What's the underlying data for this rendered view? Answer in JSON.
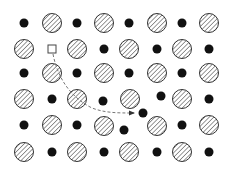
{
  "diagram": {
    "colors": {
      "background": "#ffffff",
      "atom_outline": "#333333",
      "hatch": "#555555",
      "small_atom": "#111111",
      "path": "#777777"
    },
    "large_atom_radius": 9.5,
    "small_atom_radius": 4.5,
    "large_atoms": [
      [
        52,
        23
      ],
      [
        104,
        23
      ],
      [
        157,
        23
      ],
      [
        209,
        23
      ],
      [
        24,
        49
      ],
      [
        77,
        49
      ],
      [
        129,
        49
      ],
      [
        182,
        49
      ],
      [
        52,
        73
      ],
      [
        104,
        73
      ],
      [
        157,
        73
      ],
      [
        209,
        73
      ],
      [
        24,
        99
      ],
      [
        77,
        99
      ],
      [
        130,
        99
      ],
      [
        182,
        99
      ],
      [
        52,
        125
      ],
      [
        104,
        126
      ],
      [
        157,
        126
      ],
      [
        209,
        125
      ],
      [
        24,
        152
      ],
      [
        77,
        152
      ],
      [
        129,
        152
      ],
      [
        182,
        152
      ]
    ],
    "small_atoms": [
      [
        24,
        23
      ],
      [
        77,
        23
      ],
      [
        129,
        23
      ],
      [
        182,
        23
      ],
      [
        104,
        49
      ],
      [
        157,
        49
      ],
      [
        209,
        49
      ],
      [
        24,
        73
      ],
      [
        77,
        73
      ],
      [
        129,
        73
      ],
      [
        182,
        73
      ],
      [
        52,
        99
      ],
      [
        103,
        101
      ],
      [
        161,
        96
      ],
      [
        209,
        99
      ],
      [
        24,
        125
      ],
      [
        77,
        125
      ],
      [
        124,
        130
      ],
      [
        182,
        125
      ],
      [
        52,
        152
      ],
      [
        104,
        152
      ],
      [
        157,
        152
      ],
      [
        209,
        152
      ]
    ],
    "interstitial_atom": [
      143,
      113
    ],
    "vacancy": {
      "x": 52,
      "y": 49,
      "size": 8
    },
    "migration_path": "M53,54 C58,80 72,98 92,108 C105,113 118,113 134,113",
    "arrow_tip": [
      137,
      113
    ]
  }
}
